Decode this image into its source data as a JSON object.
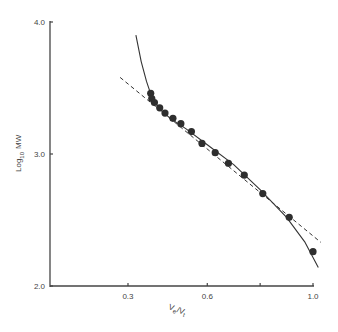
{
  "chart_data": {
    "type": "scatter",
    "title": "",
    "xlabel": "Ve/Vt",
    "xlabel_parts": {
      "v1": "V",
      "s1": "e",
      "slash": "/",
      "v2": "V",
      "s2": "t"
    },
    "ylabel": "Log10 MW",
    "ylabel_parts": {
      "log": "Log",
      "sub": "10",
      "mw": "MW"
    },
    "xlim": [
      0.0,
      1.0
    ],
    "ylim": [
      2.0,
      4.0
    ],
    "x_ticks": [
      0.3,
      0.6,
      0.8,
      1.0
    ],
    "x_tick_labels": [
      "0.3",
      "0.6",
      "",
      "1.0"
    ],
    "y_ticks": [
      2.0,
      3.0,
      4.0
    ],
    "y_tick_labels": [
      "2.0",
      "3.0",
      "4.0"
    ],
    "grid": false,
    "legend": null,
    "series": [
      {
        "name": "data points",
        "style": "filled-circle",
        "x": [
          0.386,
          0.39,
          0.4,
          0.42,
          0.44,
          0.47,
          0.5,
          0.54,
          0.58,
          0.63,
          0.68,
          0.74,
          0.81,
          0.91,
          1.0
        ],
        "y": [
          3.46,
          3.42,
          3.39,
          3.35,
          3.31,
          3.27,
          3.23,
          3.17,
          3.08,
          3.01,
          2.93,
          2.84,
          2.7,
          2.52,
          2.26
        ]
      },
      {
        "name": "fitted curve",
        "style": "solid-line",
        "x": [
          0.33,
          0.35,
          0.37,
          0.39,
          0.42,
          0.46,
          0.52,
          0.6,
          0.7,
          0.8,
          0.9,
          0.97,
          1.02
        ],
        "y": [
          3.9,
          3.7,
          3.55,
          3.43,
          3.34,
          3.27,
          3.19,
          3.07,
          2.92,
          2.73,
          2.52,
          2.33,
          2.14
        ]
      },
      {
        "name": "linear fit",
        "style": "dashed-line",
        "x": [
          0.27,
          1.03
        ],
        "y": [
          3.58,
          2.33
        ]
      }
    ]
  }
}
